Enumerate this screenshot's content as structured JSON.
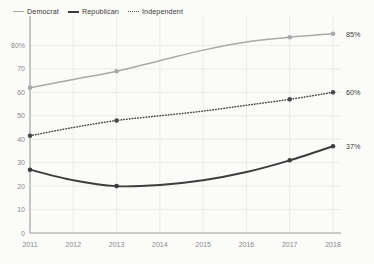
{
  "chart_data": {
    "type": "line",
    "title": "",
    "xlabel": "",
    "ylabel": "",
    "x": [
      2011,
      2012,
      2013,
      2014,
      2015,
      2016,
      2017,
      2018
    ],
    "xtick_labels": [
      "2011",
      "2012",
      "2013",
      "2014",
      "2015",
      "2016",
      "2017",
      "2018"
    ],
    "ytick_labels": [
      "0",
      "10",
      "20",
      "30",
      "40",
      "50",
      "60",
      "70",
      "80%"
    ],
    "ytick_values": [
      0,
      10,
      20,
      30,
      40,
      50,
      60,
      70,
      80
    ],
    "ylim": [
      0,
      90
    ],
    "xlim": [
      2011,
      2018
    ],
    "grid": true,
    "legend_position": "top-left",
    "series": [
      {
        "name": "Democrat",
        "color": "#a9a9a9",
        "style": "solid",
        "marker_years": [
          2011,
          2013,
          2017,
          2018
        ],
        "values": [
          62,
          65.5,
          69,
          73.5,
          78,
          81.5,
          83.5,
          85
        ],
        "end_label": "85%"
      },
      {
        "name": "Republican",
        "color": "#3d3d3d",
        "style": "solid",
        "marker_years": [
          2011,
          2013,
          2017,
          2018
        ],
        "values": [
          27,
          22.5,
          20,
          20.5,
          22.5,
          26,
          31,
          37
        ],
        "end_label": "37%"
      },
      {
        "name": "Independent",
        "color": "#4a4a4a",
        "style": "dotted",
        "marker_years": [
          2011,
          2013,
          2017,
          2018
        ],
        "values": [
          41.5,
          45,
          48,
          50,
          52,
          54.5,
          57,
          60
        ],
        "end_label": "60%"
      }
    ]
  },
  "legend": {
    "items": [
      {
        "label": "Democrat"
      },
      {
        "label": "Republican"
      },
      {
        "label": "Independent"
      }
    ]
  }
}
